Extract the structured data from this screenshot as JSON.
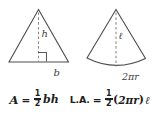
{
  "figure": {
    "background_color": "#ffffff",
    "stroke_color": "#4d4d4d",
    "dash_color": "#8a8a8a",
    "text_color": "#1f1f1f"
  },
  "triangle": {
    "name": "isosceles-triangle",
    "height_label": "h",
    "base_label": "b",
    "right_angle_mark": true,
    "height_line_style": "dashed"
  },
  "cone_sector": {
    "name": "unrolled-cone-lateral-surface",
    "slant_label": "ℓ",
    "arc_label": "2πr",
    "slant_line_style": "dashed"
  },
  "formulas": {
    "area": {
      "lhs": "A",
      "equals": "=",
      "fraction_numerator": "1",
      "fraction_denominator": "2",
      "rhs": "bh",
      "full_text": "A = 1/2 bh"
    },
    "lateral_area": {
      "lhs": "L.A.",
      "equals": "=",
      "fraction_numerator": "1",
      "fraction_denominator": "2",
      "open_paren": "(",
      "inner": "2πr",
      "close_paren": ")",
      "slant": "ℓ",
      "full_text": "L.A. = 1/2 (2πr)ℓ"
    }
  }
}
